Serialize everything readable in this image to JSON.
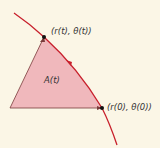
{
  "diagram": {
    "region_label": "A(t)",
    "point_t_label": "(r(t), θ(t))",
    "point_0_label": "(r(0), θ(0))",
    "colors": {
      "background": "#fbf6e6",
      "region_fill": "#f0b8bc",
      "curve": "#c8202c",
      "edges": "#7a3a3a",
      "points": "#111111"
    }
  }
}
